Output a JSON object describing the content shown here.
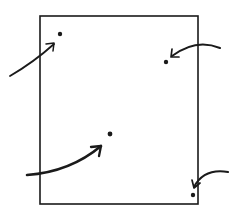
{
  "canvas": {
    "width": 239,
    "height": 212,
    "background": "#ffffff",
    "ink_color": "#1a1a1a"
  },
  "square": {
    "x": 40,
    "y": 16,
    "width": 158,
    "height": 188,
    "stroke_width": 1.6
  },
  "points": [
    {
      "id": "upper-left-point",
      "position": "upper-left",
      "cx": 60,
      "cy": 34,
      "r": 2.2,
      "arrow": {
        "from": "outside-left",
        "path": "M 10 76 Q 34 62 54 44",
        "head": "M 46 44 L 54 43 L 53 51",
        "stroke_width": 1.8
      }
    },
    {
      "id": "upper-right-point",
      "position": "upper-right",
      "cx": 166,
      "cy": 62,
      "r": 2.2,
      "arrow": {
        "from": "outside-right",
        "path": "M 220 48 Q 196 38 172 56",
        "head": "M 172 49 L 171 57 L 179 57",
        "stroke_width": 2.0
      }
    },
    {
      "id": "center-point",
      "position": "center",
      "cx": 110,
      "cy": 134,
      "r": 2.4,
      "arrow": {
        "from": "outside-left",
        "path": "M 27 175 Q 70 172 101 146",
        "head": "M 91 147 L 101 146 L 99 156",
        "stroke_width": 2.6
      }
    },
    {
      "id": "lower-right-corner-point",
      "position": "lower-right-corner",
      "cx": 193,
      "cy": 195,
      "r": 2.2,
      "arrow": {
        "from": "outside-right",
        "path": "M 228 172 Q 204 168 194 187",
        "head": "M 192 180 L 194 188 L 200 183",
        "stroke_width": 2.0
      }
    }
  ]
}
